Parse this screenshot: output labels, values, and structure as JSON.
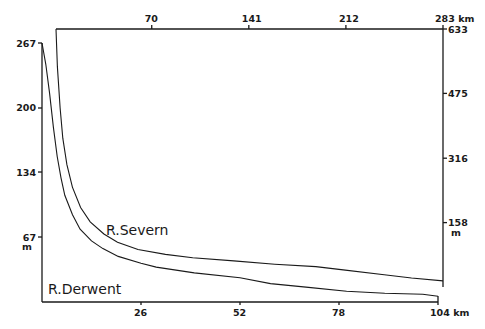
{
  "chart_data": {
    "type": "line",
    "title": "",
    "grid": false,
    "legend": "inline labels",
    "series": [
      {
        "name": "R. Severn",
        "label": "R.Severn",
        "frame": "right",
        "x_unit": "km",
        "y_unit": "m",
        "x_axis": {
          "position": "top",
          "ticks": [
            70,
            141,
            212,
            283
          ],
          "tick_labels": [
            "70",
            "141",
            "212",
            "283 km"
          ],
          "range": [
            0,
            283
          ]
        },
        "y_axis": {
          "position": "right",
          "ticks": [
            158,
            316,
            475,
            633
          ],
          "tick_labels": [
            "158",
            "316",
            "475",
            "633"
          ],
          "unit_label": "m",
          "range": [
            0,
            633
          ]
        },
        "x": [
          0,
          1,
          3,
          5,
          8,
          12,
          18,
          25,
          35,
          45,
          60,
          80,
          100,
          130,
          160,
          190,
          210,
          240,
          260,
          283
        ],
        "y": [
          633,
          540,
          440,
          365,
          300,
          245,
          195,
          160,
          130,
          110,
          92,
          80,
          72,
          64,
          56,
          50,
          42,
          30,
          22,
          15
        ]
      },
      {
        "name": "R. Derwent",
        "label": "R.Derwent",
        "frame": "left",
        "x_unit": "km",
        "y_unit": "m",
        "x_axis": {
          "position": "bottom",
          "ticks": [
            26,
            52,
            78,
            104
          ],
          "tick_labels": [
            "26",
            "52",
            "78",
            "104 km"
          ],
          "range": [
            0,
            104
          ]
        },
        "y_axis": {
          "position": "left",
          "ticks": [
            67,
            134,
            200,
            267
          ],
          "tick_labels": [
            "67",
            "134",
            "200",
            "267"
          ],
          "unit_label": "m",
          "range": [
            0,
            267
          ]
        },
        "x": [
          0,
          1,
          2,
          3,
          4,
          5,
          6,
          8,
          10,
          13,
          16,
          20,
          26,
          30,
          40,
          52,
          60,
          70,
          80,
          90,
          100,
          104
        ],
        "y": [
          267,
          245,
          215,
          180,
          150,
          128,
          110,
          90,
          75,
          63,
          55,
          47,
          40,
          36,
          30,
          25,
          19,
          15,
          11,
          9,
          8,
          6
        ]
      }
    ]
  },
  "labels": {
    "severn": "R.Severn",
    "derwent": "R.Derwent",
    "left_unit": "m",
    "right_unit": "m",
    "bottom_unit_tick": "104 km",
    "top_unit_tick": "283 km"
  }
}
